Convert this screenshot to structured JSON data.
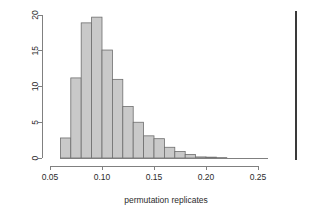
{
  "chart_data": {
    "type": "bar",
    "title": "",
    "subtitle": "",
    "xlabel": "permutation replicates",
    "ylabel": "",
    "xlim": [
      0.055,
      0.3
    ],
    "ylim": [
      0,
      20.8
    ],
    "grid": false,
    "legend": null,
    "bin_width": 0.01,
    "bin_edges": [
      0.06,
      0.07,
      0.08,
      0.09,
      0.1,
      0.11,
      0.12,
      0.13,
      0.14,
      0.15,
      0.16,
      0.17,
      0.18,
      0.19,
      0.2,
      0.21,
      0.22,
      0.23,
      0.24,
      0.25,
      0.26
    ],
    "categories": [
      "0.06-0.07",
      "0.07-0.08",
      "0.08-0.09",
      "0.09-0.10",
      "0.10-0.11",
      "0.11-0.12",
      "0.12-0.13",
      "0.13-0.14",
      "0.14-0.15",
      "0.15-0.16",
      "0.16-0.17",
      "0.17-0.18",
      "0.18-0.19",
      "0.19-0.20",
      "0.20-0.21",
      "0.21-0.22",
      "0.22-0.23",
      "0.23-0.24",
      "0.24-0.25",
      "0.25-0.26"
    ],
    "values": [
      2.8,
      11.2,
      18.9,
      19.7,
      15.1,
      11.0,
      7.2,
      5.0,
      3.1,
      2.7,
      1.5,
      0.9,
      0.5,
      0.15,
      0.12,
      0.05,
      0.0,
      0.0,
      0.0,
      0.0
    ],
    "xticks": [
      0.05,
      0.1,
      0.15,
      0.2,
      0.25
    ],
    "xtick_labels": [
      "0.05",
      "0.10",
      "0.15",
      "0.20",
      "0.25"
    ],
    "yticks": [
      0,
      5,
      10,
      15,
      20
    ],
    "ytick_labels": [
      "0",
      "5",
      "10",
      "15",
      "20"
    ],
    "annotations": [
      {
        "name": "observed-statistic-line",
        "type": "vline",
        "x": 0.2865,
        "y_top": 20.6,
        "color": "#3a3a3a"
      }
    ],
    "colors": {
      "bar_fill": "#c9c9c9",
      "bar_border": "#6e6e6e",
      "axis": "#808080",
      "text": "#2b2b2b",
      "vline": "#3a3a3a",
      "background": "#ffffff"
    }
  }
}
